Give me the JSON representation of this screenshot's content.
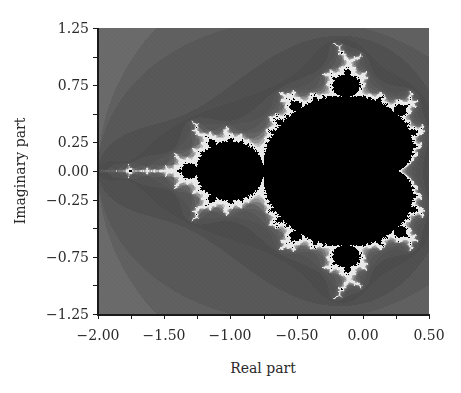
{
  "chart_data": {
    "type": "heatmap",
    "title": "",
    "xlabel": "Real part",
    "ylabel": "Imaginary part",
    "xlim": [
      -2.0,
      0.5
    ],
    "ylim": [
      -1.25,
      1.25
    ],
    "xticks": [
      -2.0,
      -1.75,
      -1.5,
      -1.25,
      -1.0,
      -0.75,
      -0.5,
      -0.25,
      0.0,
      0.25,
      0.5
    ],
    "xtick_labels": [
      "−2.00",
      "",
      "−1.50",
      "",
      "−1.00",
      "",
      "−0.50",
      "",
      "0.00",
      "",
      "0.50"
    ],
    "yticks": [
      1.25,
      1.0,
      0.75,
      0.5,
      0.25,
      0.0,
      -0.25,
      -0.5,
      -0.75,
      -1.0,
      -1.25
    ],
    "ytick_labels": [
      "1.25",
      "",
      "0.75",
      "",
      "0.25",
      "0.00",
      "−0.25",
      "",
      "−0.75",
      "",
      "−1.25"
    ],
    "grid": false,
    "legend": null,
    "colormap": "grayscale escape-time bands; set interior black, boundary near-white",
    "colors": {
      "interior": "#000000",
      "boundary": "#e6e6e6",
      "background_far": "#6a6a6a",
      "background_near": "#4e4e4e"
    },
    "max_iterations": 60
  }
}
